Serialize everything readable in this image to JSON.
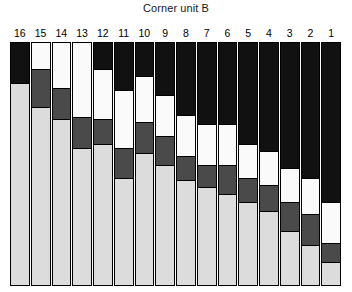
{
  "chart_data": {
    "type": "bar",
    "subtype": "stacked-bar",
    "title": "Corner unit B",
    "subtitle": "",
    "xlabel": "",
    "ylabel": "",
    "ylim": [
      0,
      100
    ],
    "grid": false,
    "legend_position": "none",
    "orientation": "vertical",
    "stack_order": "top-to-bottom",
    "categories": [
      "16",
      "15",
      "14",
      "13",
      "12",
      "11",
      "10",
      "9",
      "8",
      "7",
      "6",
      "5",
      "4",
      "3",
      "2",
      "1"
    ],
    "category_label_position": "top",
    "palette": {
      "black": "#111111",
      "dark_gray": "#4a4a4a",
      "white": "#fafafa",
      "light_gray": "#dcdcdc",
      "outline": "#000000",
      "background": "#ffffff"
    },
    "series": [
      {
        "name": "black",
        "color": "#111111",
        "values": [
          17,
          0,
          0,
          0,
          11,
          20,
          14,
          22,
          30,
          34,
          34,
          42,
          45,
          52,
          56,
          66
        ]
      },
      {
        "name": "white",
        "color": "#fafafa",
        "values": [
          0,
          11,
          19,
          31,
          21,
          24,
          19,
          17,
          17,
          17,
          17,
          14,
          14,
          14,
          15,
          17
        ]
      },
      {
        "name": "dark_gray",
        "color": "#4a4a4a",
        "values": [
          0,
          16,
          13,
          13,
          10,
          12,
          13,
          12,
          10,
          9,
          12,
          10,
          11,
          12,
          13,
          8
        ]
      },
      {
        "name": "light_gray",
        "color": "#dcdcdc",
        "values": [
          83,
          73,
          68,
          56,
          58,
          44,
          54,
          49,
          43,
          40,
          37,
          34,
          30,
          22,
          16,
          9
        ]
      }
    ],
    "columns": [
      {
        "label": "16",
        "segments": [
          {
            "color_name": "black",
            "color": "#111111",
            "percent": 17
          },
          {
            "color_name": "light_gray",
            "color": "#dcdcdc",
            "percent": 83
          }
        ]
      },
      {
        "label": "15",
        "segments": [
          {
            "color_name": "white",
            "color": "#fafafa",
            "percent": 11
          },
          {
            "color_name": "dark_gray",
            "color": "#4a4a4a",
            "percent": 16
          },
          {
            "color_name": "light_gray",
            "color": "#dcdcdc",
            "percent": 73
          }
        ]
      },
      {
        "label": "14",
        "segments": [
          {
            "color_name": "white",
            "color": "#fafafa",
            "percent": 19
          },
          {
            "color_name": "dark_gray",
            "color": "#4a4a4a",
            "percent": 13
          },
          {
            "color_name": "light_gray",
            "color": "#dcdcdc",
            "percent": 68
          }
        ]
      },
      {
        "label": "13",
        "segments": [
          {
            "color_name": "white",
            "color": "#fafafa",
            "percent": 31
          },
          {
            "color_name": "dark_gray",
            "color": "#4a4a4a",
            "percent": 13
          },
          {
            "color_name": "light_gray",
            "color": "#dcdcdc",
            "percent": 56
          }
        ]
      },
      {
        "label": "12",
        "segments": [
          {
            "color_name": "black",
            "color": "#111111",
            "percent": 11
          },
          {
            "color_name": "white",
            "color": "#fafafa",
            "percent": 21
          },
          {
            "color_name": "dark_gray",
            "color": "#4a4a4a",
            "percent": 10
          },
          {
            "color_name": "light_gray",
            "color": "#dcdcdc",
            "percent": 58
          }
        ]
      },
      {
        "label": "11",
        "segments": [
          {
            "color_name": "black",
            "color": "#111111",
            "percent": 20
          },
          {
            "color_name": "white",
            "color": "#fafafa",
            "percent": 24
          },
          {
            "color_name": "dark_gray",
            "color": "#4a4a4a",
            "percent": 12
          },
          {
            "color_name": "light_gray",
            "color": "#dcdcdc",
            "percent": 44
          }
        ]
      },
      {
        "label": "10",
        "segments": [
          {
            "color_name": "black",
            "color": "#111111",
            "percent": 14
          },
          {
            "color_name": "white",
            "color": "#fafafa",
            "percent": 19
          },
          {
            "color_name": "dark_gray",
            "color": "#4a4a4a",
            "percent": 13
          },
          {
            "color_name": "light_gray",
            "color": "#dcdcdc",
            "percent": 54
          }
        ]
      },
      {
        "label": "9",
        "segments": [
          {
            "color_name": "black",
            "color": "#111111",
            "percent": 22
          },
          {
            "color_name": "white",
            "color": "#fafafa",
            "percent": 17
          },
          {
            "color_name": "dark_gray",
            "color": "#4a4a4a",
            "percent": 12
          },
          {
            "color_name": "light_gray",
            "color": "#dcdcdc",
            "percent": 49
          }
        ]
      },
      {
        "label": "8",
        "segments": [
          {
            "color_name": "black",
            "color": "#111111",
            "percent": 30
          },
          {
            "color_name": "white",
            "color": "#fafafa",
            "percent": 17
          },
          {
            "color_name": "dark_gray",
            "color": "#4a4a4a",
            "percent": 10
          },
          {
            "color_name": "light_gray",
            "color": "#dcdcdc",
            "percent": 43
          }
        ]
      },
      {
        "label": "7",
        "segments": [
          {
            "color_name": "black",
            "color": "#111111",
            "percent": 34
          },
          {
            "color_name": "white",
            "color": "#fafafa",
            "percent": 17
          },
          {
            "color_name": "dark_gray",
            "color": "#4a4a4a",
            "percent": 9
          },
          {
            "color_name": "light_gray",
            "color": "#dcdcdc",
            "percent": 40
          }
        ]
      },
      {
        "label": "6",
        "segments": [
          {
            "color_name": "black",
            "color": "#111111",
            "percent": 34
          },
          {
            "color_name": "white",
            "color": "#fafafa",
            "percent": 17
          },
          {
            "color_name": "dark_gray",
            "color": "#4a4a4a",
            "percent": 12
          },
          {
            "color_name": "light_gray",
            "color": "#dcdcdc",
            "percent": 37
          }
        ]
      },
      {
        "label": "5",
        "segments": [
          {
            "color_name": "black",
            "color": "#111111",
            "percent": 42
          },
          {
            "color_name": "white",
            "color": "#fafafa",
            "percent": 14
          },
          {
            "color_name": "dark_gray",
            "color": "#4a4a4a",
            "percent": 10
          },
          {
            "color_name": "light_gray",
            "color": "#dcdcdc",
            "percent": 34
          }
        ]
      },
      {
        "label": "4",
        "segments": [
          {
            "color_name": "black",
            "color": "#111111",
            "percent": 45
          },
          {
            "color_name": "white",
            "color": "#fafafa",
            "percent": 14
          },
          {
            "color_name": "dark_gray",
            "color": "#4a4a4a",
            "percent": 11
          },
          {
            "color_name": "light_gray",
            "color": "#dcdcdc",
            "percent": 30
          }
        ]
      },
      {
        "label": "3",
        "segments": [
          {
            "color_name": "black",
            "color": "#111111",
            "percent": 52
          },
          {
            "color_name": "white",
            "color": "#fafafa",
            "percent": 14
          },
          {
            "color_name": "dark_gray",
            "color": "#4a4a4a",
            "percent": 12
          },
          {
            "color_name": "light_gray",
            "color": "#dcdcdc",
            "percent": 22
          }
        ]
      },
      {
        "label": "2",
        "segments": [
          {
            "color_name": "black",
            "color": "#111111",
            "percent": 56
          },
          {
            "color_name": "white",
            "color": "#fafafa",
            "percent": 15
          },
          {
            "color_name": "dark_gray",
            "color": "#4a4a4a",
            "percent": 13
          },
          {
            "color_name": "light_gray",
            "color": "#dcdcdc",
            "percent": 16
          }
        ]
      },
      {
        "label": "1",
        "segments": [
          {
            "color_name": "black",
            "color": "#111111",
            "percent": 66
          },
          {
            "color_name": "white",
            "color": "#fafafa",
            "percent": 17
          },
          {
            "color_name": "dark_gray",
            "color": "#4a4a4a",
            "percent": 8
          },
          {
            "color_name": "light_gray",
            "color": "#dcdcdc",
            "percent": 9
          }
        ]
      }
    ]
  }
}
